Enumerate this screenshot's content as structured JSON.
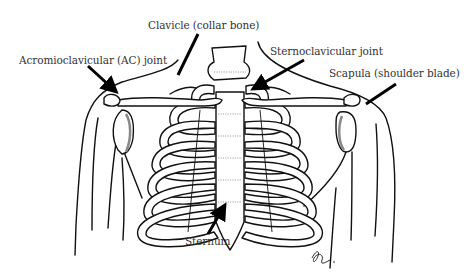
{
  "diagram": {
    "type": "anatomical line drawing",
    "labels": {
      "clavicle": "Clavicle (collar bone)",
      "ac_joint": "Acromioclavicular (AC) joint",
      "sc_joint": "Sternoclavicular joint",
      "scapula": "Scapula (shoulder blade)",
      "sternum": "Sternum"
    },
    "signature": "artist signature (illegible)",
    "colors": {
      "line": "#111111",
      "text": "#333333",
      "background": "#ffffff",
      "shading": "#888888"
    }
  }
}
